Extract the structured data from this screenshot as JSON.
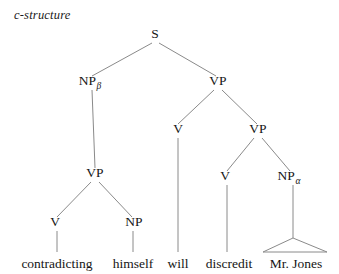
{
  "figure": {
    "caption": "c-structure",
    "background_color": "#ffffff",
    "line_color": "#8a8a8a",
    "text_color": "#151515"
  },
  "tree": {
    "nodes": [
      {
        "id": "S",
        "label": "S",
        "sub": "",
        "x": 155,
        "y": 38
      },
      {
        "id": "NPb",
        "label": "NP",
        "sub": "β",
        "x": 92,
        "y": 85
      },
      {
        "id": "VP1",
        "label": "VP",
        "sub": "",
        "x": 218,
        "y": 85
      },
      {
        "id": "V1",
        "label": "V",
        "sub": "",
        "x": 178,
        "y": 133
      },
      {
        "id": "VP2",
        "label": "VP",
        "sub": "",
        "x": 258,
        "y": 133
      },
      {
        "id": "VPleft",
        "label": "VP",
        "sub": "",
        "x": 95,
        "y": 177
      },
      {
        "id": "V2",
        "label": "V",
        "sub": "",
        "x": 225,
        "y": 180
      },
      {
        "id": "NPa",
        "label": "NP",
        "sub": "α",
        "x": 291,
        "y": 180
      },
      {
        "id": "V3",
        "label": "V",
        "sub": "",
        "x": 55,
        "y": 226
      },
      {
        "id": "NP3",
        "label": "NP",
        "sub": "",
        "x": 134,
        "y": 226
      }
    ],
    "edges": [
      {
        "from": "S",
        "to": "NPb",
        "x1": 152,
        "y1": 43,
        "x2": 92,
        "y2": 76
      },
      {
        "from": "S",
        "to": "VP1",
        "x1": 159,
        "y1": 43,
        "x2": 216,
        "y2": 76
      },
      {
        "from": "NPb",
        "to": "VPleft",
        "x1": 92,
        "y1": 90,
        "x2": 95,
        "y2": 168
      },
      {
        "from": "VP1",
        "to": "V1",
        "x1": 214,
        "y1": 90,
        "x2": 178,
        "y2": 124
      },
      {
        "from": "VP1",
        "to": "VP2",
        "x1": 222,
        "y1": 90,
        "x2": 257,
        "y2": 124
      },
      {
        "from": "V1",
        "to": "will",
        "x1": 178,
        "y1": 138,
        "x2": 178,
        "y2": 252
      },
      {
        "from": "VP2",
        "to": "V2",
        "x1": 254,
        "y1": 138,
        "x2": 227,
        "y2": 171
      },
      {
        "from": "VP2",
        "to": "NPa",
        "x1": 262,
        "y1": 138,
        "x2": 290,
        "y2": 171
      },
      {
        "from": "VPleft",
        "to": "V3",
        "x1": 91,
        "y1": 182,
        "x2": 57,
        "y2": 217
      },
      {
        "from": "VPleft",
        "to": "NP3",
        "x1": 99,
        "y1": 182,
        "x2": 132,
        "y2": 217
      },
      {
        "from": "V2",
        "to": "discredit",
        "x1": 227,
        "y1": 185,
        "x2": 227,
        "y2": 252
      },
      {
        "from": "NPa",
        "to": "triangle",
        "x1": 293,
        "y1": 185,
        "x2": 293,
        "y2": 238
      },
      {
        "from": "V3",
        "to": "contradicting",
        "x1": 57,
        "y1": 231,
        "x2": 57,
        "y2": 252
      },
      {
        "from": "NP3",
        "to": "himself",
        "x1": 133,
        "y1": 231,
        "x2": 133,
        "y2": 252
      }
    ],
    "triangle": {
      "apex_x": 293,
      "apex_y": 238,
      "left_x": 263,
      "left_y": 252,
      "right_x": 327,
      "right_y": 252
    },
    "terminals": [
      {
        "id": "contradicting",
        "label": "contradicting",
        "x": 57,
        "y": 268
      },
      {
        "id": "himself",
        "label": "himself",
        "x": 133,
        "y": 268
      },
      {
        "id": "will",
        "label": "will",
        "x": 178,
        "y": 268
      },
      {
        "id": "discredit",
        "label": "discredit",
        "x": 229,
        "y": 268
      },
      {
        "id": "mrjones",
        "label": "Mr. Jones",
        "x": 296,
        "y": 268
      }
    ]
  }
}
